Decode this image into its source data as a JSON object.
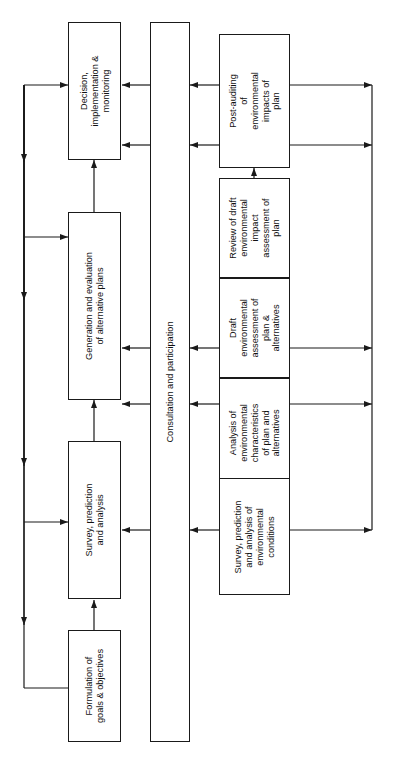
{
  "diagram": {
    "orientation": "rotated-90",
    "line_color": "#1a1a1a",
    "background": "#ffffff",
    "left_column": {
      "name": "plan-making-process",
      "nodes": [
        {
          "id": "decision",
          "label": "Decision,\nimplementation &\nmonitoring"
        },
        {
          "id": "generation",
          "label": "Generation and evaluation\nof alternative plans"
        },
        {
          "id": "survey",
          "label": "Survey, prediction\nand analysis"
        },
        {
          "id": "formulation",
          "label": "Formulation of\ngoals & objectives"
        }
      ]
    },
    "middle_column": {
      "name": "consultation-bar",
      "nodes": [
        {
          "id": "consultation",
          "label": "Consultation and participation"
        }
      ]
    },
    "right_column": {
      "name": "environmental-assessment-process",
      "nodes": [
        {
          "id": "post-audit",
          "label": "Post-auditing\nof\nenvironmental\nimpacts of\nplan"
        },
        {
          "id": "review",
          "label": "Review of draft\nenvironmental\nimpact\nassessment of\nplan"
        },
        {
          "id": "draft-ea",
          "label": "Draft\nenvironmental\nassessment of\nplan &\nalternatives"
        },
        {
          "id": "analysis",
          "label": "Analysis of\nenvironmental\ncharacteristics\nof plan and\nalternatives"
        },
        {
          "id": "env-survey",
          "label": "Survey, prediction\nand analysis of\nenvironmental\nconditions"
        }
      ]
    },
    "connectors": {
      "left_feedback_loop": "vertical line at far left carrying arrows down and branching right into plan-making boxes",
      "right_feedback_loop": "vertical line at far right carrying arrows from environmental boxes",
      "cross_links": "horizontal arrows between the consultation bar and both process columns"
    }
  }
}
